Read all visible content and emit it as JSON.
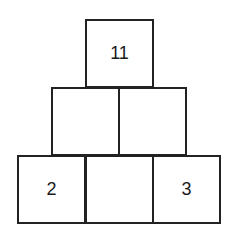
{
  "pyramid": {
    "rows": [
      {
        "cells": [
          {
            "value": "11"
          }
        ]
      },
      {
        "cells": [
          {
            "value": ""
          },
          {
            "value": ""
          }
        ]
      },
      {
        "cells": [
          {
            "value": "2"
          },
          {
            "value": ""
          },
          {
            "value": "3"
          }
        ]
      }
    ]
  },
  "colors": {
    "border": "#222222",
    "text": "#1a1a1a",
    "background": "#ffffff"
  }
}
